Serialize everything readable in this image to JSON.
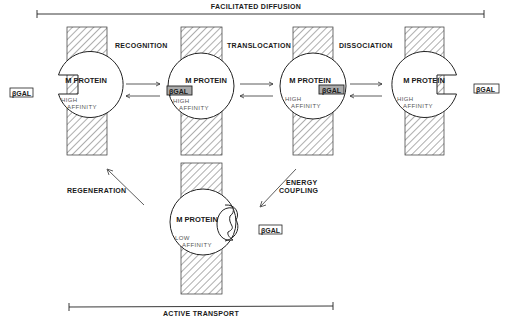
{
  "diagram": {
    "top_bracket": {
      "label": "FACILITATED DIFFUSION"
    },
    "bottom_bracket": {
      "label": "ACTIVE TRANSPORT"
    },
    "steps": [
      {
        "label": "RECOGNITION"
      },
      {
        "label": "TRANSLOCATION"
      },
      {
        "label": "DISSOCIATION"
      },
      {
        "label": "ENERGY",
        "label2": "COUPLING"
      },
      {
        "label": "REGENERATION"
      }
    ],
    "proteins": [
      {
        "name": "M PROTEIN",
        "affinity1": "HIGH",
        "affinity2": "AFFINITY",
        "state": "empty-left"
      },
      {
        "name": "M PROTEIN",
        "affinity1": "HIGH",
        "affinity2": "AFFINITY",
        "state": "bound-left",
        "bound": "βGAL"
      },
      {
        "name": "M PROTEIN",
        "affinity1": "HIGH",
        "affinity2": "AFFINITY",
        "state": "bound-right",
        "bound": "βGAL"
      },
      {
        "name": "M PROTEIN",
        "affinity1": "HIGH",
        "affinity2": "AFFINITY",
        "state": "empty-right"
      },
      {
        "name": "M PROTEIN",
        "affinity1": "LOW",
        "affinity2": "AFFINITY",
        "state": "open-right"
      }
    ],
    "free_substrate": [
      {
        "label": "βGAL",
        "position": "outside-left"
      },
      {
        "label": "βGAL",
        "position": "inside-right"
      },
      {
        "label": "βGAL",
        "position": "inside-bottom"
      }
    ]
  }
}
